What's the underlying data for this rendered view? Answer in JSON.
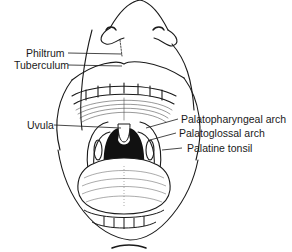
{
  "figure": {
    "labels": {
      "philtrum": "Philtrum",
      "tuberculum": "Tuberculum",
      "uvula": "Uvula",
      "palatopharyngeal_arch": "Palatopharyngeal arch",
      "palatoglossal_arch": "Palatoglossal arch",
      "palatine_tonsil": "Palatine tonsil"
    }
  }
}
